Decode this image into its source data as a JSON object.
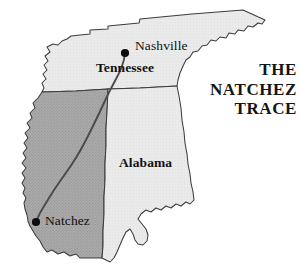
{
  "figure": {
    "kind": "reference-map",
    "title_lines": [
      "THE",
      "NATCHEZ",
      "TRACE"
    ],
    "background_color": "#ffffff"
  },
  "colors": {
    "mississippi_fill": "#a9a9a9",
    "tennessee_fill": "#e9e9e9",
    "alabama_fill": "#e6e6e6",
    "outline": "#3c3c3c",
    "trace_route": "#4a4a4a",
    "city_dot": "#0d0d0d",
    "label_text": "#111111"
  },
  "states": [
    {
      "id": "tennessee",
      "label": "Tennessee",
      "label_x": 96,
      "label_y": 68,
      "shaded": false
    },
    {
      "id": "mississippi",
      "label": "",
      "label_x": 0,
      "label_y": 0,
      "shaded": true
    },
    {
      "id": "alabama",
      "label": "Alabama",
      "label_x": 119,
      "label_y": 163,
      "shaded": false
    }
  ],
  "cities": [
    {
      "id": "nashville",
      "label": "Nashville",
      "dot_x": 125,
      "dot_y": 53,
      "label_x": 135,
      "label_y": 46
    },
    {
      "id": "natchez",
      "label": "Natchez",
      "dot_x": 36,
      "dot_y": 222,
      "label_x": 45,
      "label_y": 215
    }
  ],
  "route": {
    "id": "natchez-trace",
    "name": "Natchez Trace",
    "from": "Nashville",
    "to": "Natchez"
  }
}
